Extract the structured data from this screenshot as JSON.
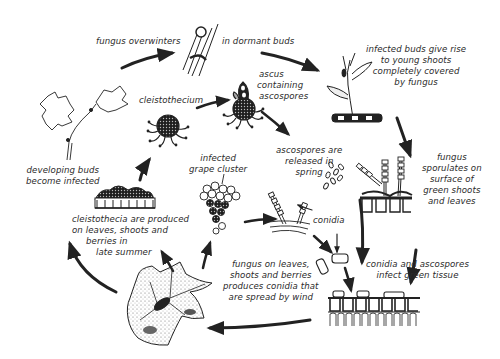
{
  "diagram": {
    "type": "life-cycle",
    "colors": {
      "ink": "#2b2b2b",
      "background": "#ffffff"
    },
    "stages": [
      {
        "id": "overwinter-a",
        "label_lines": [
          "fungus overwinters"
        ],
        "icon": "dormant-bud-icon"
      },
      {
        "id": "overwinter-b",
        "label_lines": [
          "in dormant buds"
        ]
      },
      {
        "id": "infected-buds",
        "label_lines": [
          "infected buds give rise",
          "to young shoots",
          "completely covered",
          "by fungus"
        ],
        "icon": "infected-shoot-icon"
      },
      {
        "id": "sporulation",
        "label_lines": [
          "fungus",
          "sporulates on",
          "surface of",
          "green shoots",
          "and leaves"
        ],
        "icon": "sporulating-tissue-icon"
      },
      {
        "id": "infect-green",
        "label_lines": [
          "conidia and ascospores",
          "infect green tissue"
        ],
        "icon": "leaf-tissue-icon"
      },
      {
        "id": "spread",
        "label_lines": [
          "fungus on leaves,",
          "shoots and berries",
          "produces conidia that",
          "are spread by wind"
        ],
        "icon": "infected-leaf-icon"
      },
      {
        "id": "cleistothecia-produced",
        "label_lines": [
          "cleistothecia are produced",
          "on leaves, shoots and",
          "berries in",
          "late summer"
        ],
        "icon": "cleistothecia-cluster-icon"
      },
      {
        "id": "developing-buds",
        "label_lines": [
          "developing buds",
          "become infected"
        ],
        "icon": "grape-shoot-icon"
      },
      {
        "id": "cleistothecium",
        "label_lines": [
          "cleistothecium"
        ],
        "icon": "cleistothecium-icon"
      },
      {
        "id": "ascus",
        "label_lines": [
          "ascus",
          "containing",
          "ascospores"
        ],
        "icon": "ascus-icon"
      },
      {
        "id": "ascospores-released",
        "label_lines": [
          "ascospores are",
          "released in",
          "spring"
        ],
        "icon": "ascospores-icon"
      },
      {
        "id": "grape-cluster",
        "label_lines": [
          "infected",
          "grape cluster"
        ],
        "icon": "grape-cluster-icon"
      },
      {
        "id": "conidia",
        "label_lines": [
          "conidia"
        ],
        "icon": "conidiophore-icon"
      }
    ]
  }
}
